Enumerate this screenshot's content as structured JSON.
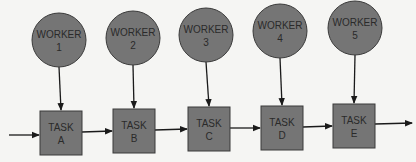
{
  "colors": {
    "background": "#f5f5f3",
    "shape_fill": "#757575",
    "shape_stroke": "#3a3a3a",
    "line": "#1a1a1a",
    "text": "#2a2a2a"
  },
  "workers": [
    {
      "line1": "WORKER",
      "line2": "1",
      "cx": 59,
      "cy": 40
    },
    {
      "line1": "WORKER",
      "line2": "2",
      "cx": 133,
      "cy": 38
    },
    {
      "line1": "WORKER",
      "line2": "3",
      "cx": 206,
      "cy": 35
    },
    {
      "line1": "WORKER",
      "line2": "4",
      "cx": 280,
      "cy": 31
    },
    {
      "line1": "WORKER",
      "line2": "5",
      "cx": 355,
      "cy": 28
    }
  ],
  "tasks": [
    {
      "line1": "TASK",
      "line2": "A",
      "x": 40,
      "y": 111
    },
    {
      "line1": "TASK",
      "line2": "B",
      "x": 113,
      "y": 109
    },
    {
      "line1": "TASK",
      "line2": "C",
      "x": 188,
      "y": 107
    },
    {
      "line1": "TASK",
      "line2": "D",
      "x": 261,
      "y": 106
    },
    {
      "line1": "TASK",
      "line2": "E",
      "x": 333,
      "y": 104
    }
  ],
  "geometry": {
    "radius": 27,
    "box_w": 42,
    "box_h": 44
  }
}
